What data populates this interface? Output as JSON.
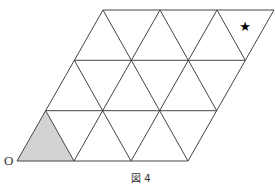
{
  "figure": {
    "caption": "図 4",
    "origin_label": "O",
    "marker": "★",
    "grid": {
      "description": "Parallelogram divided into equilateral triangles: 3 rows, each with 3 upward and 3 downward triangles",
      "rows": 3,
      "cols": 3,
      "line_color": "#444444",
      "fill_shaded": "#d3d3d3"
    },
    "shaded_triangle": "bottom-left upward triangle at origin O",
    "star_position": "top-right downward triangle"
  }
}
